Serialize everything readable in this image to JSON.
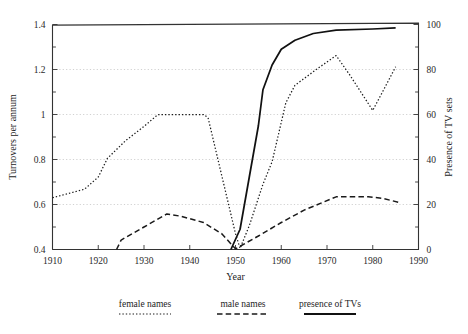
{
  "chart_data": {
    "type": "line",
    "title": "",
    "subtitle": "",
    "xlabel": "Year",
    "ylabel": "Turnovers per annum",
    "y2label": "Presence of TV sets",
    "xlim": [
      1910,
      1990
    ],
    "ylim": [
      0.4,
      1.4
    ],
    "y2lim": [
      0,
      100
    ],
    "xticks": [
      "1910",
      "1920",
      "1930",
      "1940",
      "1950",
      "1960",
      "1970",
      "1980",
      "1990"
    ],
    "xtick_values": [
      1910,
      1920,
      1930,
      1940,
      1950,
      1960,
      1970,
      1980,
      1990
    ],
    "yticks": [
      "0.4",
      "0.6",
      "0.8",
      "1",
      "1.2",
      "1.4"
    ],
    "ytick_values": [
      0.4,
      0.6,
      0.8,
      1.0,
      1.2,
      1.4
    ],
    "y2ticks": [
      "0",
      "20",
      "40",
      "60",
      "80",
      "100"
    ],
    "y2tick_values": [
      0,
      20,
      40,
      60,
      80,
      100
    ],
    "grid": true,
    "grid_axis": "y",
    "legend_position": "bottom",
    "series": [
      {
        "name": "female names",
        "style": "dotted",
        "axis": "left",
        "points": [
          [
            1910,
            0.63
          ],
          [
            1917,
            0.668
          ],
          [
            1920,
            0.722
          ],
          [
            1922,
            0.805
          ],
          [
            1926,
            0.884
          ],
          [
            1930,
            0.947
          ],
          [
            1933,
            0.999
          ],
          [
            1943,
            1.0
          ],
          [
            1944,
            0.986
          ],
          [
            1950,
            0.47
          ],
          [
            1951,
            0.405
          ],
          [
            1953,
            0.505
          ],
          [
            1956,
            0.69
          ],
          [
            1958,
            0.79
          ],
          [
            1961,
            1.052
          ],
          [
            1963,
            1.13
          ],
          [
            1968,
            1.205
          ],
          [
            1972,
            1.262
          ],
          [
            1975,
            1.175
          ],
          [
            1980,
            1.018
          ],
          [
            1982,
            1.095
          ],
          [
            1985,
            1.212
          ]
        ]
      },
      {
        "name": "male names",
        "style": "dashed",
        "axis": "left",
        "points": [
          [
            1924,
            0.4
          ],
          [
            1925,
            0.442
          ],
          [
            1930,
            0.5
          ],
          [
            1935,
            0.558
          ],
          [
            1938,
            0.548
          ],
          [
            1943,
            0.52
          ],
          [
            1947,
            0.47
          ],
          [
            1950,
            0.403
          ],
          [
            1955,
            0.46
          ],
          [
            1960,
            0.52
          ],
          [
            1965,
            0.575
          ],
          [
            1972,
            0.634
          ],
          [
            1979,
            0.634
          ],
          [
            1982,
            0.628
          ],
          [
            1986,
            0.608
          ]
        ]
      },
      {
        "name": "presence of TVs",
        "style": "solid",
        "axis": "right",
        "points": [
          [
            1949,
            0.0
          ],
          [
            1951,
            9.0
          ],
          [
            1953,
            32.0
          ],
          [
            1955,
            55.0
          ],
          [
            1956,
            71.0
          ],
          [
            1958,
            82.0
          ],
          [
            1960,
            89.0
          ],
          [
            1963,
            93.0
          ],
          [
            1967,
            96.0
          ],
          [
            1972,
            97.5
          ],
          [
            1980,
            98.0
          ],
          [
            1985,
            98.5
          ]
        ]
      }
    ],
    "legend": [
      {
        "label": "female names",
        "style": "dotted"
      },
      {
        "label": "male names",
        "style": "dashed"
      },
      {
        "label": "presence of TVs",
        "style": "solid"
      }
    ]
  }
}
